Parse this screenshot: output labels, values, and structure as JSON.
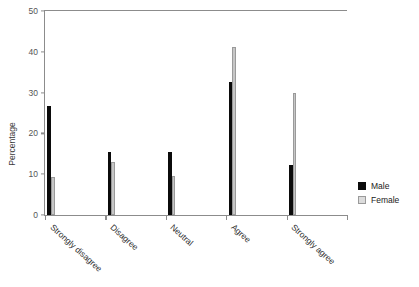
{
  "chart_data": {
    "type": "bar",
    "title": "",
    "xlabel": "",
    "ylabel": "Percentage",
    "ylim": [
      0,
      50
    ],
    "yticks": [
      0,
      10,
      20,
      30,
      40,
      50
    ],
    "grid": false,
    "legend_position": "right",
    "categories": [
      "Strongly disagree",
      "Disagree",
      "Neutral",
      "Agree",
      "Strongly agree"
    ],
    "series": [
      {
        "name": "Male",
        "color": "#0b0b0b",
        "values": [
          26.6,
          15.4,
          15.5,
          32.5,
          12.3
        ]
      },
      {
        "name": "Female",
        "color": "#c6c6c6",
        "values": [
          9.2,
          13.1,
          9.6,
          41.3,
          29.8
        ]
      }
    ]
  },
  "axis": {
    "y_tick_labels": [
      "0",
      "10",
      "20",
      "30",
      "40",
      "50"
    ],
    "y_axis_title": "Percentage"
  },
  "legend": {
    "entries": [
      {
        "label": "Male"
      },
      {
        "label": "Female"
      }
    ]
  },
  "colors": {
    "male": "#0b0b0b",
    "female": "#c6c6c6",
    "axis": "#8c8c8c",
    "background": "#ffffff",
    "tick_text": "#555555"
  }
}
